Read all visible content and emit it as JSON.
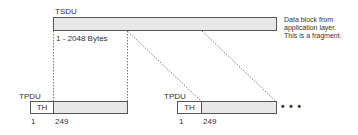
{
  "tsdu": {
    "label": "TSDU",
    "size_label": "1 - 2048 Bytes",
    "note_lines": [
      "Data block from",
      "application layer.",
      "This is a fragment."
    ]
  },
  "tpdus": [
    {
      "label": "TPDU",
      "header": "TH",
      "start": "1",
      "end": "249"
    },
    {
      "label": "TPDU",
      "header": "TH",
      "start": "1",
      "end": "249"
    }
  ],
  "continuation": "• • •",
  "colors": {
    "border": "#555555",
    "fill": "#e8e8e8",
    "text": "#333333"
  }
}
